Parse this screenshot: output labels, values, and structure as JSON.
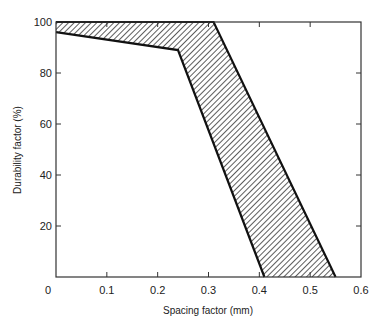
{
  "chart_data": {
    "type": "area",
    "title": "",
    "xlabel": "Spacing factor (mm)",
    "ylabel": "Durability factor (%)",
    "xlim": [
      0,
      0.6
    ],
    "ylim": [
      0,
      100
    ],
    "x_ticks": [
      0,
      0.1,
      0.2,
      0.3,
      0.4,
      0.5,
      0.6
    ],
    "x_tick_labels": [
      "0",
      "0.1",
      "0.2",
      "0.3",
      "0.4",
      "0.5",
      "0.6"
    ],
    "y_ticks": [
      20,
      40,
      60,
      80,
      100
    ],
    "y_tick_labels": [
      "20",
      "40",
      "60",
      "80",
      "100"
    ],
    "grid": false,
    "legend": null,
    "fill_style": "diagonal-hatch",
    "series": [
      {
        "name": "Upper boundary",
        "points": [
          [
            0,
            100
          ],
          [
            0.31,
            100
          ],
          [
            0.55,
            0
          ]
        ]
      },
      {
        "name": "Lower boundary",
        "points": [
          [
            0,
            96
          ],
          [
            0.24,
            89
          ],
          [
            0.41,
            0
          ]
        ]
      }
    ]
  }
}
